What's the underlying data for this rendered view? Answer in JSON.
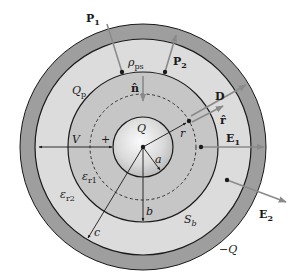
{
  "figure": {
    "colors": {
      "outer_shell": "#9e9e9e",
      "dielectric_2": "#dcdcdc",
      "dielectric_1": "#c4c4c4",
      "inner_sphere_light": "#f4f4f4",
      "inner_sphere_dark": "#bdbdbd",
      "stroke": "#1a1a1a",
      "arrow": "#8a8a8a"
    },
    "labels": {
      "P1": "P",
      "P1_sub": "1",
      "P2": "P",
      "P2_sub": "2",
      "rho_ps": "ρ",
      "rho_ps_sub": "ps",
      "n_hat": "n̂",
      "Q_p": "Q",
      "Q_p_sub": "p",
      "D": "D",
      "r_hat": "r̂",
      "r": "r",
      "E1": "E",
      "E1_sub": "1",
      "E2": "E",
      "E2_sub": "2",
      "Q": "Q",
      "neg_Q": "−Q",
      "V": "V",
      "plus": "+",
      "a": "a",
      "b": "b",
      "c": "c",
      "eps_r1": "ε",
      "eps_r1_sub": "r1",
      "eps_r2": "ε",
      "eps_r2_sub": "r2",
      "S_b": "S",
      "S_b_sub": "b"
    }
  }
}
